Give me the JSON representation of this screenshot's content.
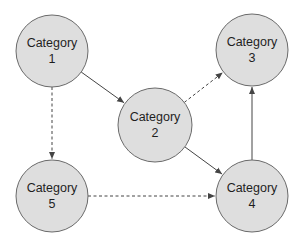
{
  "diagram": {
    "type": "directed-graph",
    "width": 307,
    "height": 244,
    "colors": {
      "node_fill": "#dedede",
      "node_stroke": "#6a6a6a",
      "edge": "#444444",
      "text": "#1e1e1e",
      "background": "#ffffff"
    },
    "nodes": [
      {
        "id": "1",
        "line1": "Category",
        "line2": "1",
        "cx": 52,
        "cy": 51,
        "r": 36
      },
      {
        "id": "2",
        "line1": "Category",
        "line2": "2",
        "cx": 155,
        "cy": 125,
        "r": 37
      },
      {
        "id": "3",
        "line1": "Category",
        "line2": "3",
        "cx": 252,
        "cy": 50,
        "r": 36
      },
      {
        "id": "4",
        "line1": "Category",
        "line2": "4",
        "cx": 252,
        "cy": 196,
        "r": 36
      },
      {
        "id": "5",
        "line1": "Category",
        "line2": "5",
        "cx": 52,
        "cy": 196,
        "r": 36
      }
    ],
    "edges": [
      {
        "from": "1",
        "to": "2",
        "style": "solid"
      },
      {
        "from": "1",
        "to": "5",
        "style": "dashed"
      },
      {
        "from": "2",
        "to": "3",
        "style": "dashed"
      },
      {
        "from": "2",
        "to": "4",
        "style": "solid"
      },
      {
        "from": "5",
        "to": "4",
        "style": "dashed"
      },
      {
        "from": "4",
        "to": "3",
        "style": "solid"
      }
    ]
  }
}
